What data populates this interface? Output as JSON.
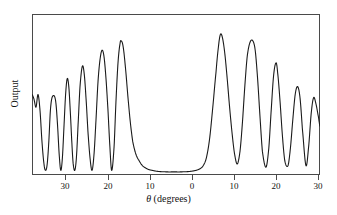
{
  "figure": {
    "background_color": "#ffffff",
    "frame_color": "#4a4a4a",
    "curve_color": "#1a1a1a"
  },
  "axes": {
    "x_title_symbol": "θ",
    "x_title_rest": " (degrees)",
    "x_title_full": "θ (degrees)",
    "y_title": "Output"
  },
  "chart_data": {
    "type": "line",
    "title": "",
    "subtitle": "",
    "xlabel": "θ (degrees)",
    "ylabel": "Output",
    "legend": [],
    "legend_position": "none",
    "grid": false,
    "xlim": [
      -36,
      36
    ],
    "ylim": [
      0,
      1
    ],
    "x_tick_labels": [
      "30",
      "20",
      "10",
      "0",
      "10",
      "20",
      "30"
    ],
    "x_tick_values": [
      -30,
      -20,
      -10,
      0,
      10,
      20,
      30
    ],
    "y_tick_labels": [],
    "y_tick_values": [],
    "note": "Symmetric-style angular scan: x tick labels show absolute degrees on both sides of 0.",
    "peaks": [
      {
        "x": -34.5,
        "y": 0.5
      },
      {
        "x": -30.4,
        "y": 0.49
      },
      {
        "x": -27.2,
        "y": 0.6
      },
      {
        "x": -23.4,
        "y": 0.68
      },
      {
        "x": -18.5,
        "y": 0.78
      },
      {
        "x": -13.7,
        "y": 0.84
      },
      {
        "x": 11.1,
        "y": 0.88
      },
      {
        "x": 19.2,
        "y": 0.84
      },
      {
        "x": 25.4,
        "y": 0.7
      },
      {
        "x": 30.4,
        "y": 0.55
      },
      {
        "x": 34.4,
        "y": 0.48
      }
    ],
    "valleys": [
      {
        "x": -32.6,
        "y": 0.02
      },
      {
        "x": -28.8,
        "y": 0.02
      },
      {
        "x": -25.3,
        "y": 0.02
      },
      {
        "x": -21.0,
        "y": 0.02
      },
      {
        "x": -16.1,
        "y": 0.02
      },
      {
        "x": 0.0,
        "y": 0.01
      },
      {
        "x": 15.3,
        "y": 0.06
      },
      {
        "x": 22.5,
        "y": 0.04
      },
      {
        "x": 28.0,
        "y": 0.05
      },
      {
        "x": 32.5,
        "y": 0.05
      }
    ],
    "series": [
      {
        "name": "Output",
        "x": [
          -36.0,
          -35.5,
          -35.0,
          -34.5,
          -34.0,
          -33.5,
          -33.0,
          -32.6,
          -32.2,
          -31.8,
          -31.4,
          -31.0,
          -30.4,
          -30.0,
          -29.6,
          -29.2,
          -28.8,
          -28.4,
          -28.0,
          -27.6,
          -27.2,
          -26.8,
          -26.4,
          -26.0,
          -25.7,
          -25.3,
          -24.9,
          -24.5,
          -24.0,
          -23.4,
          -22.9,
          -22.4,
          -22.0,
          -21.5,
          -21.0,
          -20.5,
          -20.0,
          -19.5,
          -19.0,
          -18.5,
          -18.0,
          -17.5,
          -17.0,
          -16.6,
          -16.1,
          -15.5,
          -15.0,
          -14.5,
          -14.0,
          -13.7,
          -13.2,
          -12.6,
          -12.0,
          -11.4,
          -10.8,
          -10.0,
          -9.2,
          -8.4,
          -7.6,
          -6.8,
          -6.0,
          -5.0,
          -4.0,
          -3.0,
          -2.0,
          -1.0,
          0.0,
          1.0,
          2.0,
          3.0,
          4.0,
          5.0,
          6.0,
          6.8,
          7.6,
          8.4,
          9.2,
          10.0,
          10.6,
          11.1,
          11.6,
          12.2,
          12.8,
          13.4,
          14.0,
          14.6,
          15.3,
          16.0,
          16.6,
          17.2,
          17.8,
          18.5,
          19.2,
          19.8,
          20.4,
          21.0,
          21.6,
          22.5,
          23.2,
          23.8,
          24.4,
          25.0,
          25.4,
          26.0,
          26.6,
          27.2,
          28.0,
          28.6,
          29.2,
          29.8,
          30.4,
          31.0,
          31.6,
          32.5,
          33.2,
          33.8,
          34.4,
          35.0,
          35.6,
          36.0
        ],
        "values": [
          0.5,
          0.47,
          0.42,
          0.5,
          0.4,
          0.2,
          0.06,
          0.02,
          0.06,
          0.2,
          0.4,
          0.48,
          0.49,
          0.44,
          0.3,
          0.12,
          0.02,
          0.1,
          0.3,
          0.5,
          0.6,
          0.55,
          0.38,
          0.18,
          0.06,
          0.02,
          0.1,
          0.3,
          0.55,
          0.68,
          0.62,
          0.44,
          0.26,
          0.1,
          0.02,
          0.12,
          0.34,
          0.58,
          0.72,
          0.78,
          0.74,
          0.6,
          0.4,
          0.2,
          0.02,
          0.16,
          0.46,
          0.7,
          0.82,
          0.84,
          0.8,
          0.66,
          0.48,
          0.32,
          0.2,
          0.12,
          0.08,
          0.05,
          0.035,
          0.025,
          0.02,
          0.015,
          0.012,
          0.011,
          0.01,
          0.01,
          0.01,
          0.01,
          0.011,
          0.012,
          0.015,
          0.02,
          0.03,
          0.05,
          0.1,
          0.22,
          0.42,
          0.64,
          0.8,
          0.88,
          0.86,
          0.76,
          0.6,
          0.42,
          0.26,
          0.13,
          0.06,
          0.14,
          0.32,
          0.55,
          0.74,
          0.83,
          0.84,
          0.78,
          0.6,
          0.36,
          0.14,
          0.04,
          0.16,
          0.4,
          0.62,
          0.7,
          0.64,
          0.46,
          0.24,
          0.08,
          0.05,
          0.16,
          0.34,
          0.5,
          0.55,
          0.48,
          0.28,
          0.05,
          0.18,
          0.38,
          0.48,
          0.44,
          0.36,
          0.3
        ]
      }
    ]
  },
  "x_ticks": [
    {
      "label": "30",
      "px": 65
    },
    {
      "label": "20",
      "px": 108
    },
    {
      "label": "10",
      "px": 150
    },
    {
      "label": "0",
      "px": 192
    },
    {
      "label": "10",
      "px": 234
    },
    {
      "label": "20",
      "px": 276
    },
    {
      "label": "30",
      "px": 318
    }
  ]
}
